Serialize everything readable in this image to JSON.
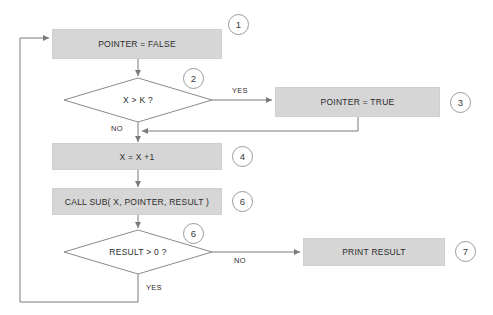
{
  "diagram": {
    "background_color": "#ffffff",
    "node_fill_color": "#d6d6d6",
    "line_color": "#808080",
    "text_color": "#2b2b2b",
    "nodes": [
      {
        "id": "n1",
        "type": "process",
        "label": "POINTER = FALSE",
        "callout": "1"
      },
      {
        "id": "n2",
        "type": "decision",
        "label": "X > K ?",
        "callout": "2"
      },
      {
        "id": "n3",
        "type": "process",
        "label": "POINTER = TRUE",
        "callout": "3"
      },
      {
        "id": "n4",
        "type": "process",
        "label": "X = X +1",
        "callout": "4"
      },
      {
        "id": "n5",
        "type": "process",
        "label": "CALL SUB( X, POINTER, RESULT )",
        "callout": "5"
      },
      {
        "id": "n6",
        "type": "decision",
        "label": "RESULT > 0 ?",
        "callout": "6"
      },
      {
        "id": "n7",
        "type": "process",
        "label": "PRINT RESULT",
        "callout": "7"
      }
    ],
    "edge_labels": {
      "decision1_yes": "YES",
      "decision1_no": "NO",
      "decision2_no": "NO",
      "decision2_yes": "YES"
    }
  }
}
